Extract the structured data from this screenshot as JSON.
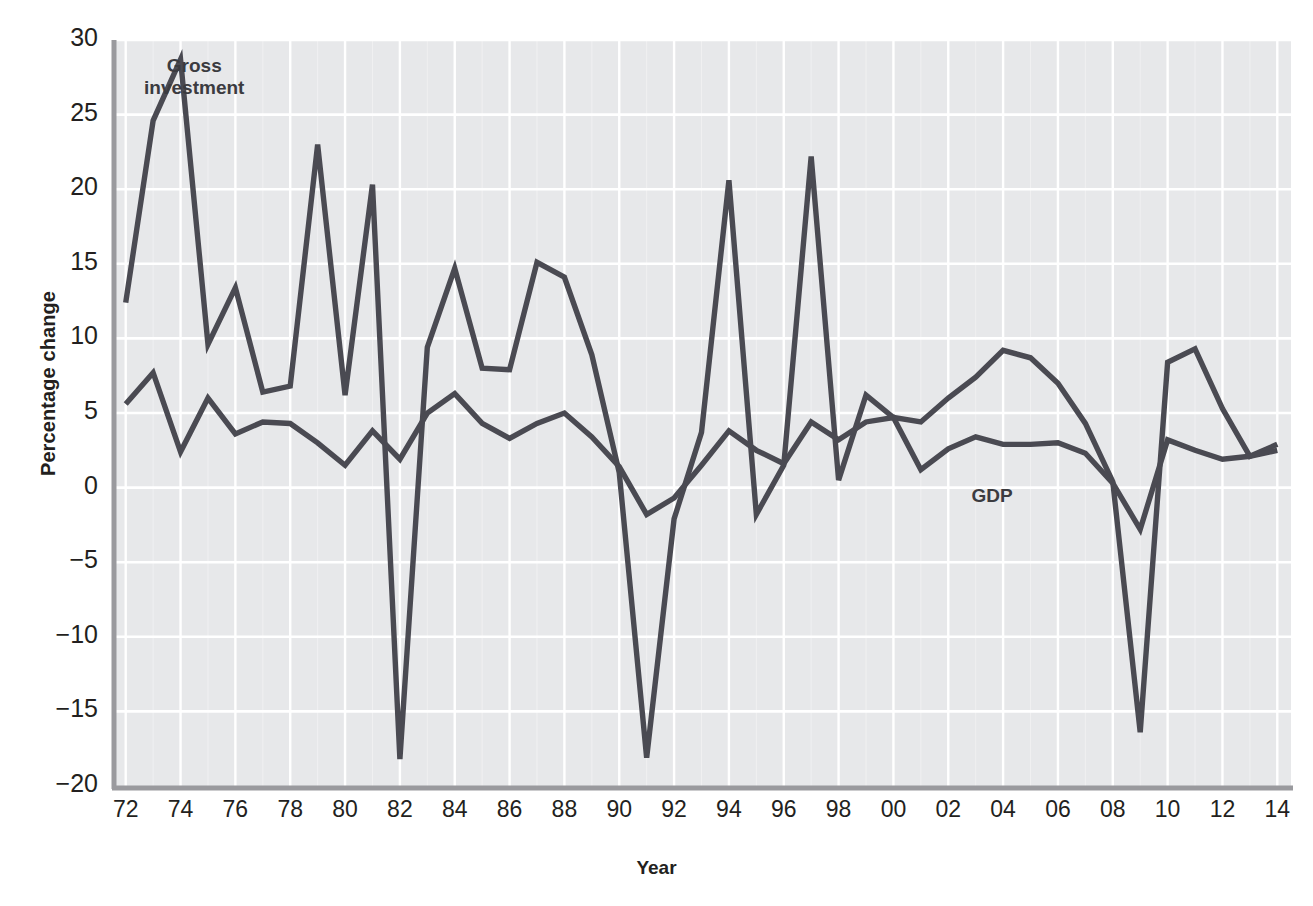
{
  "figure": {
    "cut_caption": "",
    "plot": {
      "left": 112,
      "top": 40,
      "right": 1291,
      "bottom": 786
    },
    "background_color": "#e7e8ea",
    "gridline_color": "#ffffff",
    "axis_color": "#9a9a9e",
    "line_color": "#4a4a52"
  },
  "axes": {
    "ylabel": "Percentage change",
    "xlabel": "Year",
    "yticks": [
      30,
      25,
      20,
      15,
      10,
      5,
      0,
      -5,
      -10,
      -15,
      -20
    ],
    "ytick_labels": [
      "30",
      "25",
      "20",
      "15",
      "10",
      "5",
      "0",
      "−5",
      "−10",
      "−15",
      "−20"
    ],
    "xticks": [
      1972,
      1974,
      1976,
      1978,
      1980,
      1982,
      1984,
      1986,
      1988,
      1990,
      1992,
      1994,
      1996,
      1998,
      2000,
      2002,
      2004,
      2006,
      2008,
      2010,
      2012,
      2014
    ],
    "xtick_labels": [
      "72",
      "74",
      "76",
      "78",
      "80",
      "82",
      "84",
      "86",
      "88",
      "90",
      "92",
      "94",
      "96",
      "98",
      "00",
      "02",
      "04",
      "06",
      "08",
      "10",
      "12",
      "14"
    ]
  },
  "annotations": {
    "gross_investment_label": "Gross\ninvestment",
    "gross_investment_label_line1": "Gross",
    "gross_investment_label_line2": "investment",
    "gdp_label": "GDP"
  },
  "chart_data": {
    "type": "line",
    "title": "",
    "xlabel": "Year",
    "ylabel": "Percentage change",
    "xlim": [
      1971.5,
      2014.5
    ],
    "ylim": [
      -20,
      30
    ],
    "grid": true,
    "legend": "inline-labels",
    "x": [
      1972,
      1973,
      1974,
      1975,
      1976,
      1977,
      1978,
      1979,
      1980,
      1981,
      1982,
      1983,
      1984,
      1985,
      1986,
      1987,
      1988,
      1989,
      1990,
      1991,
      1992,
      1993,
      1994,
      1995,
      1996,
      1997,
      1998,
      1999,
      2000,
      2001,
      2002,
      2003,
      2004,
      2005,
      2006,
      2007,
      2008,
      2009,
      2010,
      2011,
      2012,
      2013,
      2014
    ],
    "series": [
      {
        "name": "Gross investment",
        "values": [
          12.4,
          24.6,
          28.7,
          9.6,
          13.4,
          6.4,
          6.8,
          23.0,
          6.2,
          20.3,
          -18.2,
          9.4,
          14.7,
          8.0,
          7.9,
          15.1,
          14.1,
          8.9,
          1.0,
          -18.1,
          -2.1,
          3.7,
          20.6,
          -1.8,
          1.5,
          22.2,
          0.5,
          6.2,
          4.7,
          4.4,
          6.0,
          7.4,
          9.2,
          8.7,
          7.0,
          4.3,
          0.4,
          -16.4,
          8.4,
          9.3,
          5.3,
          2.1,
          2.9
        ],
        "label_position": {
          "x": 1974.5,
          "y": 27.5
        }
      },
      {
        "name": "GDP",
        "values": [
          5.6,
          7.7,
          2.4,
          6.0,
          3.6,
          4.4,
          4.3,
          3.0,
          1.5,
          3.8,
          1.9,
          5.0,
          6.3,
          4.3,
          3.3,
          4.3,
          5.0,
          3.4,
          1.4,
          -1.8,
          -0.7,
          1.5,
          3.8,
          2.5,
          1.6,
          4.4,
          3.2,
          4.4,
          4.7,
          1.2,
          2.6,
          3.4,
          2.9,
          2.9,
          3.0,
          2.3,
          0.3,
          -2.8,
          3.2,
          2.5,
          1.9,
          2.1,
          2.5
        ],
        "label_position": {
          "x": 2003.5,
          "y": 1.1
        }
      }
    ]
  }
}
